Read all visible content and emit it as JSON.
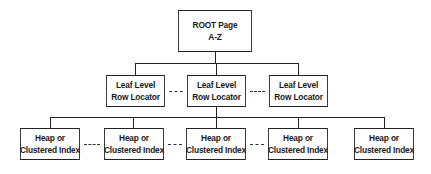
{
  "diagram": {
    "root": {
      "line1": "ROOT Page",
      "line2": "A-Z"
    },
    "leaf_level": [
      {
        "line1": "Leaf Level",
        "line2": "Row Locator"
      },
      {
        "line1": "Leaf Level",
        "line2": "Row Locator"
      },
      {
        "line1": "Leaf Level",
        "line2": "Row Locator"
      }
    ],
    "data_level": [
      {
        "line1": "Heap or",
        "line2": "Clustered Index"
      },
      {
        "line1": "Heap or",
        "line2": "Clustered Index"
      },
      {
        "line1": "Heap or",
        "line2": "Clustered Index"
      },
      {
        "line1": "Heap or",
        "line2": "Clustered Index"
      },
      {
        "line1": "Heap or",
        "line2": "Clustered Index"
      }
    ],
    "colors": {
      "stroke": "#222222",
      "background": "#ffffff",
      "text": "#1a1a1a"
    }
  }
}
